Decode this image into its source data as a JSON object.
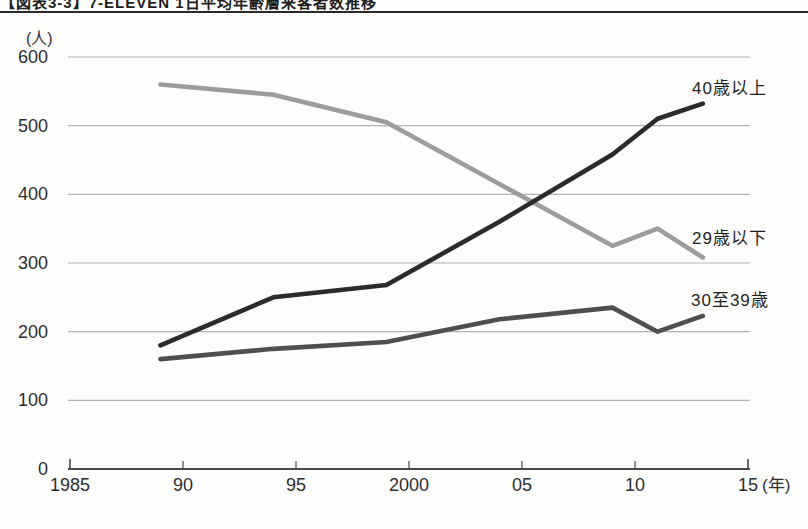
{
  "header": {
    "title": "【図表3-3】7-ELEVEN 1日平均年齢層来客者数推移"
  },
  "chart_data": {
    "type": "line",
    "x": [
      1989,
      1994,
      1999,
      2004,
      2009,
      2011,
      2013
    ],
    "series": [
      {
        "name": "40歳以上",
        "color": "#2b2b2b",
        "values": [
          180,
          250,
          268,
          360,
          458,
          510,
          532
        ]
      },
      {
        "name": "29歳以下",
        "color": "#9c9c9c",
        "values": [
          560,
          545,
          505,
          415,
          325,
          350,
          308
        ]
      },
      {
        "name": "30至39歳",
        "color": "#4f4f4f",
        "values": [
          160,
          175,
          185,
          218,
          235,
          200,
          223
        ]
      }
    ],
    "ylabel": "(人)",
    "x_unit_label": "(年)",
    "ylim": [
      0,
      600
    ],
    "yticks": [
      0,
      100,
      200,
      300,
      400,
      500,
      600
    ],
    "xlim": [
      1985,
      2015
    ],
    "xticks": [
      {
        "value": 1985,
        "label": "1985"
      },
      {
        "value": 1990,
        "label": "90"
      },
      {
        "value": 1995,
        "label": "95"
      },
      {
        "value": 2000,
        "label": "2000"
      },
      {
        "value": 2005,
        "label": "05"
      },
      {
        "value": 2010,
        "label": "10"
      },
      {
        "value": 2015,
        "label": "15"
      }
    ],
    "grid": "horizontal",
    "colors": {
      "gridline": "#b3b3b3",
      "axis": "#4a4a4a",
      "tick_text": "#2e2e2e"
    }
  }
}
